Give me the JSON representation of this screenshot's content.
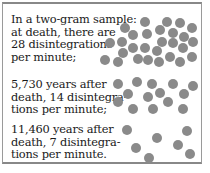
{
  "captions": [
    {
      "text": "In a two-gram sample:\nat death, there are\n28 disintegrations\nper minute;",
      "count": 28
    },
    {
      "text": "5,730 years after\ndeath, 14 disintegra-\ntions per minute;",
      "count": 14
    },
    {
      "text": "11,460 years after\ndeath, 7 disintegra-\ntions per minute.",
      "count": 7
    }
  ],
  "colors": {
    "dot": "#8a8a8a",
    "border": "#9a9a9a"
  },
  "dots": {
    "group_28": [
      [
        145,
        22
      ],
      [
        167,
        22
      ],
      [
        180,
        23
      ],
      [
        125,
        28
      ],
      [
        160,
        30
      ],
      [
        192,
        28
      ],
      [
        133,
        35
      ],
      [
        147,
        34
      ],
      [
        173,
        33
      ],
      [
        184,
        37
      ],
      [
        110,
        43
      ],
      [
        122,
        42
      ],
      [
        162,
        42
      ],
      [
        173,
        43
      ],
      [
        193,
        42
      ],
      [
        133,
        48
      ],
      [
        145,
        48
      ],
      [
        157,
        51
      ],
      [
        183,
        48
      ],
      [
        123,
        53
      ],
      [
        170,
        57
      ],
      [
        192,
        57
      ],
      [
        105,
        60
      ],
      [
        118,
        62
      ],
      [
        138,
        59
      ],
      [
        148,
        60
      ],
      [
        159,
        62
      ],
      [
        180,
        62
      ]
    ],
    "group_14": [
      [
        118,
        84
      ],
      [
        137,
        82
      ],
      [
        152,
        84
      ],
      [
        173,
        84
      ],
      [
        193,
        86
      ],
      [
        128,
        94
      ],
      [
        160,
        93
      ],
      [
        148,
        97
      ],
      [
        184,
        94
      ],
      [
        118,
        102
      ],
      [
        168,
        102
      ],
      [
        133,
        109
      ],
      [
        153,
        109
      ],
      [
        183,
        109
      ]
    ],
    "group_7": [
      [
        127,
        130
      ],
      [
        187,
        131
      ],
      [
        157,
        138
      ],
      [
        136,
        148
      ],
      [
        178,
        145
      ],
      [
        190,
        154
      ],
      [
        149,
        158
      ]
    ]
  }
}
